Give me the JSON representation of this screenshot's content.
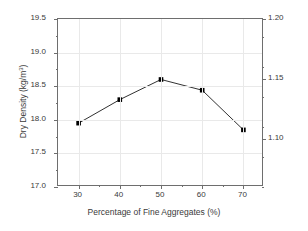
{
  "chart_data": {
    "type": "line",
    "title": "",
    "xlabel": "Percentage of Fine Aggregates (%)",
    "ylabel": "Dry Density (kg/m",
    "ylabel_exponent": "3",
    "ylabel_right": "Dry Density (lb/ft",
    "ylabel_right_exponent": "3",
    "x": [
      30,
      40,
      50,
      60,
      70
    ],
    "values": [
      17.95,
      18.3,
      18.6,
      18.44,
      17.85
    ],
    "series": [
      {
        "name": "Dry Density",
        "values": [
          17.95,
          18.3,
          18.6,
          18.44,
          17.85
        ],
        "marker": "square",
        "color": "#000000"
      }
    ],
    "xlim": [
      25,
      75
    ],
    "ylim": [
      17.0,
      19.5
    ],
    "ylim_right": [
      1.06,
      1.2
    ],
    "xticks": [
      30,
      40,
      50,
      60,
      70
    ],
    "xticklabels": [
      "30",
      "40",
      "50",
      "60",
      "70"
    ],
    "yticks": [
      17.0,
      17.5,
      18.0,
      18.5,
      19.0,
      19.5
    ],
    "yticklabels": [
      "17.0",
      "17.5",
      "18.0",
      "18.5",
      "19.0",
      "19.5"
    ],
    "yticks_right": [
      1.1,
      1.15,
      1.2
    ],
    "yticklabels_right": [
      "1.10",
      "1.15",
      "1.20"
    ],
    "grid": true,
    "legend": "none",
    "line_color": "#1a1a1a",
    "grid_color": "#e9e9e9",
    "axis_color": "#6e6e6e",
    "background": "#ffffff"
  }
}
